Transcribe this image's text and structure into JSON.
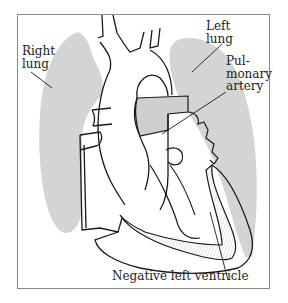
{
  "figure": {
    "type": "anatomical-diagram",
    "colors": {
      "lung_fill": "#d4d4d4",
      "outline": "#1a1a1a",
      "frame": "#8a8a8a",
      "background": "#ffffff",
      "hatch": "#9a9a9a"
    },
    "labels": {
      "right_lung": "Right\nlung",
      "left_lung": "Left\nlung",
      "pulmonary_artery": "Pul-\nmonary\nartery",
      "negative_left_ventricle": "Negative left ventricle"
    }
  }
}
